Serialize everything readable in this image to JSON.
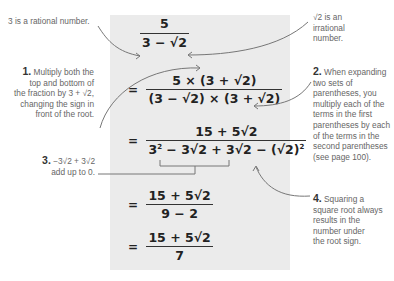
{
  "equation": {
    "step0": {
      "numerator": "5",
      "denominator": "3 − √2"
    },
    "step1": {
      "equals": "=",
      "numerator": "5 × (3 + √2)",
      "denominator": "(3 − √2) × (3 + √2)"
    },
    "step2": {
      "equals": "=",
      "numerator": "15 + 5√2",
      "denominator_a": "3",
      "denominator_a_exp": "2",
      "denominator_b": " − 3√2 + 3√2 − (√2)",
      "denominator_b_exp": "2"
    },
    "step3": {
      "equals": "=",
      "numerator": "15 + 5√2",
      "denominator": "9 − 2"
    },
    "step4": {
      "equals": "=",
      "numerator": "15 + 5√2",
      "denominator": "7"
    }
  },
  "annotations": {
    "rational": "3 is a rational number.",
    "irrational_line1": "√2 is an",
    "irrational_line2": "irrational",
    "irrational_line3": "number.",
    "note1": {
      "num": "1.",
      "l1": " Multiply both the",
      "l2": "top and bottom of",
      "l3": "the fraction by 3 + √2,",
      "l4": "changing the sign in",
      "l5": "front of the root."
    },
    "note2": {
      "num": "2.",
      "l1": " When expanding",
      "l2": "two sets of",
      "l3": "parentheses, you",
      "l4": "multiply each of the",
      "l5": "terms in the first",
      "l6": "parentheses by each",
      "l7": "of the terms in the",
      "l8": "second parentheses",
      "l9": "(see page 100)."
    },
    "note3": {
      "num": "3.",
      "l1": " −3√2 + 3√2",
      "l2": "add up to 0."
    },
    "note4": {
      "num": "4.",
      "l1": " Squaring a",
      "l2": "square root always",
      "l3": "results in the",
      "l4": "number under",
      "l5": "the root sign."
    }
  },
  "colors": {
    "panel": "#ebebeb",
    "arrow": "#777777",
    "text": "#666666"
  }
}
